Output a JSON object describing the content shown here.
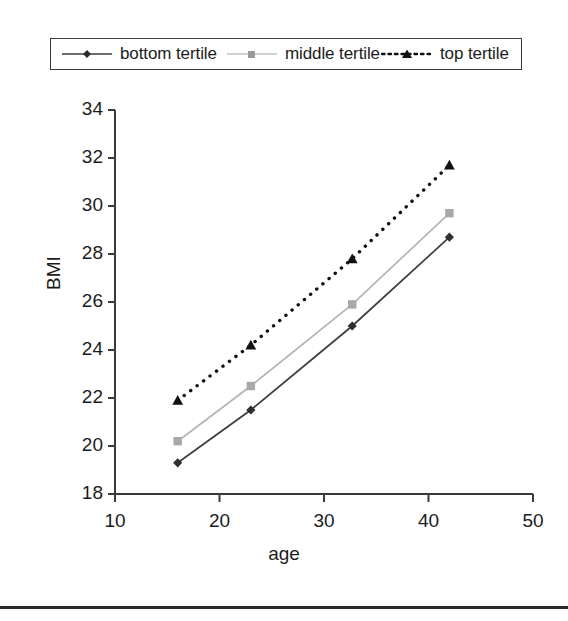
{
  "chart_data": {
    "type": "line",
    "title": "",
    "xlabel": "age",
    "ylabel": "BMI",
    "xlim": [
      10,
      50
    ],
    "ylim": [
      18,
      34
    ],
    "xticks": [
      10,
      20,
      30,
      40,
      50
    ],
    "yticks": [
      18,
      20,
      22,
      24,
      26,
      28,
      30,
      32,
      34
    ],
    "grid": false,
    "legend_position": "top",
    "x": [
      16,
      23,
      32.7,
      42
    ],
    "series": [
      {
        "name": "bottom tertile",
        "values": [
          19.3,
          21.5,
          25.0,
          28.7
        ],
        "color": "#3d3d3d",
        "marker": "diamond",
        "line_style": "solid"
      },
      {
        "name": "middle tertile",
        "values": [
          20.2,
          22.5,
          25.9,
          29.7
        ],
        "color": "#b4b4b4",
        "marker": "square",
        "line_style": "solid"
      },
      {
        "name": "top tertile",
        "values": [
          21.9,
          24.2,
          27.8,
          31.7
        ],
        "color": "#111111",
        "marker": "triangle",
        "line_style": "dotted"
      }
    ]
  },
  "axes": {
    "x_tick_labels": [
      "10",
      "20",
      "30",
      "40",
      "50"
    ],
    "y_tick_labels": [
      "18",
      "20",
      "22",
      "24",
      "26",
      "28",
      "30",
      "32",
      "34"
    ],
    "x_axis_title": "age",
    "y_axis_title": "BMI"
  },
  "legend": {
    "entries": [
      {
        "label": "bottom tertile"
      },
      {
        "label": "middle tertile"
      },
      {
        "label": "top tertile"
      }
    ]
  },
  "colors": {
    "axis": "#3a3a3a",
    "text": "#1c1c1c",
    "series_bottom": "#3d3d3d",
    "series_middle": "#b4b4b4",
    "series_top": "#111111",
    "footer_rule": "#2a2a2a"
  }
}
